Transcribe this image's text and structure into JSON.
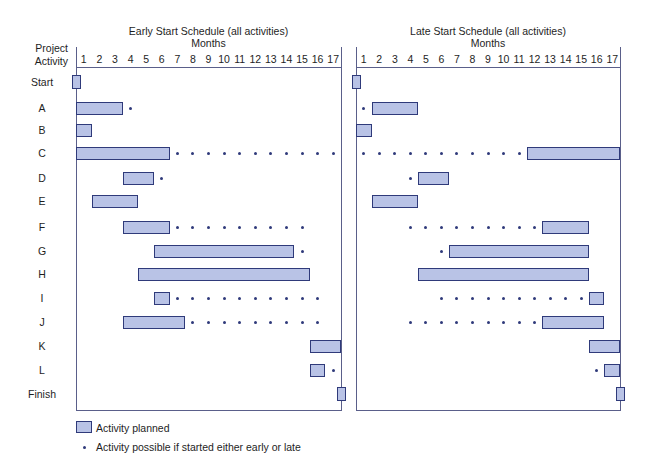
{
  "chart_data": [
    {
      "type": "gantt",
      "title": "Early Start Schedule (all activities)",
      "xlabel": "Months",
      "ylabel": "Project Activity",
      "months": [
        1,
        2,
        3,
        4,
        5,
        6,
        7,
        8,
        9,
        10,
        11,
        12,
        13,
        14,
        15,
        16,
        17
      ],
      "activities": [
        {
          "name": "Start",
          "bar": [
            0,
            0
          ],
          "milestone": true,
          "dots": []
        },
        {
          "name": "A",
          "bar": [
            1,
            3
          ],
          "dots": [
            4
          ]
        },
        {
          "name": "B",
          "bar": [
            1,
            1
          ],
          "dots": []
        },
        {
          "name": "C",
          "bar": [
            1,
            6
          ],
          "dots": [
            7,
            8,
            9,
            10,
            11,
            12,
            13,
            14,
            15,
            16,
            17
          ]
        },
        {
          "name": "D",
          "bar": [
            4,
            5
          ],
          "dots": [
            6
          ]
        },
        {
          "name": "E",
          "bar": [
            2,
            4
          ],
          "dots": []
        },
        {
          "name": "F",
          "bar": [
            4,
            6
          ],
          "dots": [
            7,
            8,
            9,
            10,
            11,
            12,
            13,
            14,
            15
          ]
        },
        {
          "name": "G",
          "bar": [
            6,
            14
          ],
          "dots": [
            15
          ]
        },
        {
          "name": "H",
          "bar": [
            5,
            15
          ],
          "dots": []
        },
        {
          "name": "I",
          "bar": [
            6,
            6
          ],
          "dots": [
            7,
            8,
            9,
            10,
            11,
            12,
            13,
            14,
            15,
            16
          ]
        },
        {
          "name": "J",
          "bar": [
            4,
            7
          ],
          "dots": [
            8,
            9,
            10,
            11,
            12,
            13,
            14,
            15,
            16
          ]
        },
        {
          "name": "K",
          "bar": [
            16,
            17
          ],
          "dots": []
        },
        {
          "name": "L",
          "bar": [
            16,
            16
          ],
          "dots": [
            17
          ]
        },
        {
          "name": "Finish",
          "bar": [
            17,
            17
          ],
          "milestone": true,
          "dots": []
        }
      ]
    },
    {
      "type": "gantt",
      "title": "Late Start Schedule (all activities)",
      "xlabel": "Months",
      "months": [
        1,
        2,
        3,
        4,
        5,
        6,
        7,
        8,
        9,
        10,
        11,
        12,
        13,
        14,
        15,
        16,
        17
      ],
      "activities": [
        {
          "name": "Start",
          "bar": [
            0,
            0
          ],
          "milestone": true,
          "dots": []
        },
        {
          "name": "A",
          "bar": [
            2,
            4
          ],
          "dots": [
            1
          ]
        },
        {
          "name": "B",
          "bar": [
            1,
            1
          ],
          "dots": []
        },
        {
          "name": "C",
          "bar": [
            12,
            17
          ],
          "dots": [
            1,
            2,
            3,
            4,
            5,
            6,
            7,
            8,
            9,
            10,
            11
          ]
        },
        {
          "name": "D",
          "bar": [
            5,
            6
          ],
          "dots": [
            4
          ]
        },
        {
          "name": "E",
          "bar": [
            2,
            4
          ],
          "dots": []
        },
        {
          "name": "F",
          "bar": [
            13,
            15
          ],
          "dots": [
            4,
            5,
            6,
            7,
            8,
            9,
            10,
            11,
            12
          ]
        },
        {
          "name": "G",
          "bar": [
            7,
            15
          ],
          "dots": [
            6
          ]
        },
        {
          "name": "H",
          "bar": [
            5,
            15
          ],
          "dots": []
        },
        {
          "name": "I",
          "bar": [
            16,
            16
          ],
          "dots": [
            6,
            7,
            8,
            9,
            10,
            11,
            12,
            13,
            14,
            15
          ]
        },
        {
          "name": "J",
          "bar": [
            13,
            16
          ],
          "dots": [
            4,
            5,
            6,
            7,
            8,
            9,
            10,
            11,
            12
          ]
        },
        {
          "name": "K",
          "bar": [
            16,
            17
          ],
          "dots": []
        },
        {
          "name": "L",
          "bar": [
            17,
            17
          ],
          "dots": [
            16
          ]
        },
        {
          "name": "Finish",
          "bar": [
            17,
            17
          ],
          "milestone": true,
          "dots": []
        }
      ]
    }
  ],
  "labels": {
    "early_title": "Early Start Schedule (all activities)",
    "late_title": "Late Start Schedule (all activities)",
    "months": "Months",
    "y_label_line1": "Project",
    "y_label_line2": "Activity"
  },
  "legend": {
    "bar_label": "Activity planned",
    "dot_label": "Activity possible if started either early or late"
  },
  "colors": {
    "bar_fill": "#b9c3e6",
    "bar_stroke": "#2f3a7a",
    "axis": "#5a5f8a"
  }
}
